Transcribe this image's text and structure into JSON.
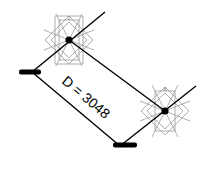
{
  "diagram": {
    "dimension_label": "D = 3048",
    "nodes": [
      {
        "id": "1",
        "label": "1",
        "x": 69,
        "y": 40
      },
      {
        "id": "8",
        "label": "8",
        "x": 165,
        "y": 111
      }
    ],
    "colors": {
      "line": "#000000",
      "symbol": "#9a9a9a",
      "background": "#ffffff"
    }
  }
}
